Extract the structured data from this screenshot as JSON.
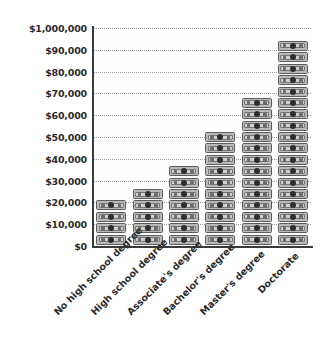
{
  "chart_data": {
    "type": "bar",
    "title": "",
    "subtitle": "",
    "xlabel": "",
    "ylabel": "",
    "categories": [
      "No high school degree",
      "High school degree",
      "Associate's degree",
      "Bachelor's degree",
      "Master's degree",
      "Doctorate"
    ],
    "values": [
      22000,
      28000,
      36000,
      52000,
      66000,
      92000
    ],
    "value_unit": "USD",
    "ylim": [
      0,
      100000
    ],
    "ytick_values": [
      0,
      10000,
      20000,
      30000,
      40000,
      50000,
      60000,
      70000,
      80000,
      90000,
      100000
    ],
    "ytick_labels": [
      "$0",
      "$10,000",
      "$20,000",
      "$30,000",
      "$40,000",
      "$50,000",
      "$60,000",
      "$70,000",
      "$80,000",
      "$90,000",
      "$1,000,000"
    ],
    "grid": true,
    "grid_style": "dotted",
    "legend": false,
    "legend_position": "none",
    "marker": "banknote-icon",
    "marker_unit_value": 5000,
    "bar_bill_counts": [
      4,
      5,
      7,
      10,
      13,
      18
    ],
    "colors": {
      "bill_fill": "#b9b9b9",
      "bill_inner": "#cfcfcf",
      "bill_outline": "#5c5c5c",
      "bill_portrait": "#2e2e2e",
      "gridline": "#9b9b9b",
      "axis": "#3a3a3a",
      "text": "#2b2b2b",
      "plot_background": "#fdfdfd",
      "page_background": "#ffffff"
    }
  }
}
